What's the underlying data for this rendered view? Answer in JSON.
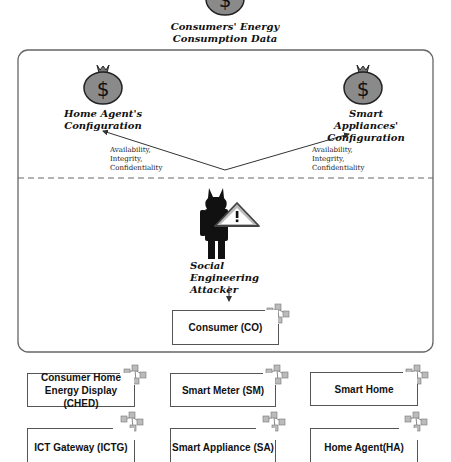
{
  "diagram": {
    "top_asset": {
      "label": "Consumers' Energy Consumption Data",
      "icon": "money-bag-icon"
    },
    "left_asset": {
      "label_line1": "Home Agent's",
      "label_line2": "Configuration",
      "icon": "money-bag-icon"
    },
    "right_asset": {
      "label_line1": "Smart Appliances'",
      "label_line2": "Configuration",
      "icon": "money-bag-icon"
    },
    "left_properties": [
      "Availability,",
      "Integrity,",
      "Confidentiality"
    ],
    "right_properties": [
      "Availability,",
      "Integrity,",
      "Confidentiality"
    ],
    "attacker": {
      "label_line1": "Social Engineering",
      "label_line2": "Attacker",
      "icon": "devil-attacker-warning-icon"
    },
    "target": {
      "label": "Consumer (CO)"
    },
    "components": [
      {
        "label_line1": "Consumer Home",
        "label_line2": "Energy Display (CHED)"
      },
      {
        "label": "Smart Meter (SM)"
      },
      {
        "label": "Smart Home"
      },
      {
        "label": "ICT Gateway (ICTG)"
      },
      {
        "label": "Smart Appliance (SA)"
      },
      {
        "label": "Home Agent(HA)"
      }
    ],
    "colors": {
      "bag": "#8a8a8a",
      "line": "#555555",
      "dashed": "#666666"
    }
  }
}
